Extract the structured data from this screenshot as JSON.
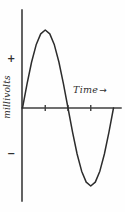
{
  "chart_data": {
    "type": "line",
    "title": "",
    "subtitle": "",
    "xlabel": "Time",
    "ylabel": "millivolts",
    "xlabel_arrow": "→",
    "positive_sign": "+",
    "negative_sign": "−",
    "style": "hand-drawn sine wave, one full cycle",
    "grid": false,
    "legend": false,
    "legend_position": "none",
    "xlim": [
      0,
      4
    ],
    "ylim": [
      -1.15,
      1.15
    ],
    "x_tick_labels": [
      "",
      "",
      ""
    ],
    "x_ticks": [
      1,
      2,
      3
    ],
    "y_ticks": [],
    "y_tick_labels": [],
    "annotations": [
      {
        "text": "+",
        "role": "positive-polarity-marker",
        "axis": "y",
        "value": 0.8
      },
      {
        "text": "−",
        "role": "negative-polarity-marker",
        "axis": "y",
        "value": -0.85
      },
      {
        "text": "Time →",
        "role": "x-axis-label",
        "axis": "x"
      },
      {
        "text": "millivolts",
        "role": "y-axis-label",
        "axis": "y"
      }
    ],
    "series": [
      {
        "name": "voltage",
        "x": [
          0.0,
          0.2,
          0.4,
          0.6,
          0.8,
          1.0,
          1.2,
          1.4,
          1.6,
          1.8,
          2.0,
          2.2,
          2.4,
          2.6,
          2.8,
          3.0,
          3.2,
          3.4,
          3.6,
          3.8,
          4.0
        ],
        "values": [
          0.0,
          0.31,
          0.59,
          0.81,
          0.95,
          1.0,
          0.95,
          0.81,
          0.59,
          0.31,
          0.0,
          -0.31,
          -0.59,
          -0.81,
          -0.95,
          -1.0,
          -0.95,
          -0.81,
          -0.59,
          -0.31,
          0.0
        ]
      }
    ],
    "key_points": {
      "start": {
        "x": 0.0,
        "y": 0.0
      },
      "peak": {
        "x": 1.0,
        "y": 1.0
      },
      "zero_crossing": {
        "x": 2.0,
        "y": 0.0
      },
      "trough": {
        "x": 3.0,
        "y": -1.0
      },
      "end": {
        "x": 4.0,
        "y": 0.0
      }
    },
    "colors": {
      "background": "#fefefe",
      "curve": "#2c2c2c",
      "axis": "#3b3b3b",
      "text": "#2f2f2f"
    }
  }
}
